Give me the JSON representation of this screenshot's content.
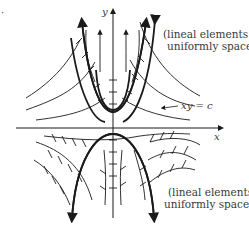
{
  "figure": {
    "axis_labels": {
      "x": "x",
      "y": "y"
    },
    "curve_label": "xy = c",
    "annotation_top": [
      "(lineal elements not",
      "uniformly spaced)"
    ],
    "annotation_bottom": [
      "(lineal elements",
      "uniformly spaced)"
    ],
    "stray_mark": "·",
    "colors": {
      "ink": "#1a1a1a",
      "text": "#3a3a3a",
      "background": "#ffffff"
    }
  }
}
